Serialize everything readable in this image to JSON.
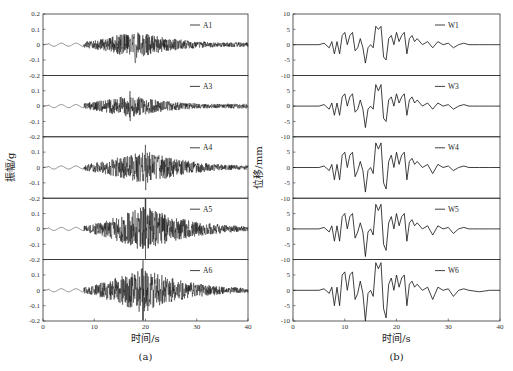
{
  "chart_data": [
    {
      "type": "line",
      "panel": "(a)",
      "xlabel": "时间/s",
      "ylabel": "振幅/g",
      "xlim": [
        0,
        40
      ],
      "xticks": [
        0,
        10,
        20,
        30,
        40
      ],
      "ylim": [
        -0.2,
        0.2
      ],
      "yticks": [
        0.2,
        0.1,
        0,
        -0.1,
        -0.2
      ],
      "ytick_labels": [
        "0.2",
        "0.1",
        "0",
        "-0.1",
        "-0.2"
      ],
      "grid": false,
      "legend_position": "upper right",
      "series": [
        {
          "name": "A1",
          "description": "acceleration time history; quiet until ~8 s, strong shaking 8–28 s, peak ≈ ±0.12 g near 18 s, decays to ~0.02 g by 40 s",
          "peak": 0.12,
          "peak_time": 18
        },
        {
          "name": "A3",
          "description": "acceleration time history; strong shaking 8–28 s, peak ≈ ±0.1 g near 15–18 s",
          "peak": 0.1,
          "peak_time": 17
        },
        {
          "name": "A4",
          "description": "acceleration time history; strong shaking 9–28 s, peak ≈ ±0.15 g near 20 s",
          "peak": 0.15,
          "peak_time": 20
        },
        {
          "name": "A5",
          "description": "acceleration time history; strong shaking 9–30 s, peak ≈ 0.2 g spike near 20 s",
          "peak": 0.2,
          "peak_time": 20
        },
        {
          "name": "A6",
          "description": "acceleration time history; strong shaking 9–30 s, peak ≈ ±0.2 g near 19–20 s",
          "peak": 0.2,
          "peak_time": 19.5
        }
      ]
    },
    {
      "type": "line",
      "panel": "(b)",
      "xlabel": "时间/s",
      "ylabel": "位移/mm",
      "xlim": [
        0,
        40
      ],
      "xticks": [
        0,
        10,
        20,
        30,
        40
      ],
      "ylim": [
        -10,
        10
      ],
      "yticks": [
        10,
        5,
        0,
        -5,
        -10
      ],
      "ytick_labels": [
        "10",
        "5",
        "0",
        "-5",
        "-10"
      ],
      "grid": false,
      "legend_position": "upper right",
      "series": [
        {
          "name": "W1",
          "x": [
            0,
            5,
            6,
            7,
            7.5,
            8,
            8.5,
            9,
            9.5,
            10,
            10.5,
            11,
            11.5,
            12,
            12.5,
            13,
            13.5,
            14,
            14.5,
            15,
            15.5,
            16,
            16.5,
            17,
            17.5,
            18,
            18.5,
            19,
            19.5,
            20,
            20.5,
            21,
            21.5,
            22,
            22.5,
            23,
            23.5,
            24,
            25,
            26,
            27,
            28,
            29,
            30,
            31,
            32,
            33,
            34,
            36,
            38,
            40
          ],
          "y": [
            0,
            0,
            0.5,
            -1,
            1,
            -3,
            1,
            -3,
            3,
            4,
            0,
            3,
            4,
            -2,
            -1,
            2,
            -1,
            -6,
            -1,
            0,
            -1,
            6,
            5,
            6,
            -4,
            -5,
            2,
            3,
            0,
            4,
            1,
            3,
            4,
            -3,
            2,
            3,
            1,
            2,
            0,
            1,
            -1,
            1,
            0,
            0.5,
            -1,
            0,
            0.5,
            0,
            0,
            0,
            0
          ]
        },
        {
          "name": "W3",
          "x": [
            0,
            5,
            6,
            7,
            7.5,
            8,
            8.5,
            9,
            9.5,
            10,
            10.5,
            11,
            11.5,
            12,
            12.5,
            13,
            13.5,
            14,
            14.5,
            15,
            15.5,
            16,
            16.5,
            17,
            17.5,
            18,
            18.5,
            19,
            19.5,
            20,
            20.5,
            21,
            21.5,
            22,
            22.5,
            23,
            23.5,
            24,
            25,
            26,
            27,
            28,
            29,
            30,
            31,
            32,
            33,
            34,
            36,
            38,
            40
          ],
          "y": [
            0,
            0,
            0.5,
            -1,
            1,
            -3,
            1,
            -3,
            3,
            4,
            0,
            3,
            4,
            -2,
            -1,
            2,
            -1,
            -7,
            -1,
            0,
            -1,
            7,
            5,
            7,
            -4,
            -5,
            2,
            3,
            0,
            4,
            1,
            3,
            4,
            -3,
            2,
            3,
            1,
            2,
            0,
            1,
            -1,
            1,
            0,
            0.5,
            -1,
            0,
            0.5,
            0,
            0,
            0,
            0
          ]
        },
        {
          "name": "W4",
          "x": [
            0,
            5,
            6,
            7,
            7.5,
            8,
            8.5,
            9,
            9.5,
            10,
            10.5,
            11,
            11.5,
            12,
            12.5,
            13,
            13.5,
            14,
            14.5,
            15,
            15.5,
            16,
            16.5,
            17,
            17.5,
            18,
            18.5,
            19,
            19.5,
            20,
            20.5,
            21,
            21.5,
            22,
            22.5,
            23,
            23.5,
            24,
            25,
            26,
            27,
            28,
            29,
            30,
            31,
            32,
            33,
            34,
            36,
            38,
            40
          ],
          "y": [
            0,
            0,
            0.5,
            -1,
            1,
            -4,
            1,
            -4,
            4,
            5,
            0,
            4,
            5,
            -3,
            -1,
            2,
            -1,
            -8,
            -1,
            0,
            -2,
            8,
            6,
            8,
            -5,
            -7,
            2,
            4,
            0,
            5,
            1,
            4,
            5,
            -4,
            2,
            3,
            1,
            2,
            0,
            1,
            -2,
            1,
            0,
            0.5,
            -1,
            0,
            0.5,
            0,
            0,
            0,
            0
          ]
        },
        {
          "name": "W5",
          "x": [
            0,
            5,
            6,
            7,
            7.5,
            8,
            8.5,
            9,
            9.5,
            10,
            10.5,
            11,
            11.5,
            12,
            12.5,
            13,
            13.5,
            14,
            14.5,
            15,
            15.5,
            16,
            16.5,
            17,
            17.5,
            18,
            18.5,
            19,
            19.5,
            20,
            20.5,
            21,
            21.5,
            22,
            22.5,
            23,
            23.5,
            24,
            25,
            26,
            27,
            28,
            29,
            30,
            31,
            32,
            33,
            34,
            36,
            38,
            40
          ],
          "y": [
            0,
            0,
            0.5,
            -1,
            1,
            -4,
            1,
            -4,
            4,
            5,
            0,
            4,
            5,
            -3,
            -1,
            2,
            -1,
            -9,
            -1,
            0,
            -2,
            8,
            6,
            8,
            -5,
            -7,
            2,
            4,
            0,
            5,
            1,
            4,
            5,
            -4,
            2,
            3,
            1,
            2,
            0,
            1,
            -2,
            1,
            0,
            0.5,
            -1.5,
            0,
            0.5,
            0,
            0,
            0,
            0
          ]
        },
        {
          "name": "W6",
          "x": [
            0,
            5,
            6,
            7,
            7.5,
            8,
            8.5,
            9,
            9.5,
            10,
            10.5,
            11,
            11.5,
            12,
            12.5,
            13,
            13.5,
            14,
            14.5,
            15,
            15.5,
            16,
            16.5,
            17,
            17.5,
            18,
            18.5,
            19,
            19.5,
            20,
            20.5,
            21,
            21.5,
            22,
            22.5,
            23,
            23.5,
            24,
            25,
            26,
            27,
            28,
            29,
            30,
            31,
            32,
            33,
            34,
            36,
            38,
            40
          ],
          "y": [
            0,
            0,
            0.5,
            -1,
            1,
            -5,
            1,
            -5,
            5,
            6,
            0,
            5,
            6,
            -3,
            -1,
            3,
            -1,
            -10,
            -1,
            0,
            -2,
            9,
            7,
            9,
            -6,
            -9,
            2,
            4,
            0,
            5,
            1,
            4,
            5,
            -5,
            2,
            3,
            1,
            2,
            0,
            1,
            -3,
            1,
            0,
            0.5,
            -2,
            0,
            0.5,
            0,
            -0.5,
            0,
            0
          ]
        }
      ]
    }
  ],
  "figure": {
    "left_caption": "(a)",
    "right_caption": "(b)"
  }
}
